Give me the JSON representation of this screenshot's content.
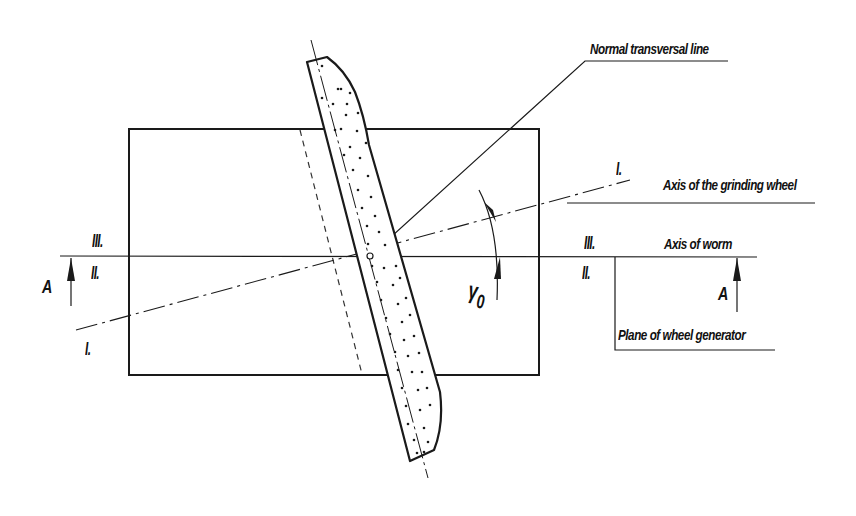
{
  "diagram": {
    "type": "technical drawing — worm grinding wheel setup",
    "colors": {
      "line": "#1a1a1a",
      "background": "#ffffff"
    },
    "labels": {
      "normal_transversal_line": "Normal transversal line",
      "axis_grinding_wheel": "Axis of the grinding wheel",
      "axis_worm": "Axis of worm",
      "plane_wheel_generator": "Plane of wheel generator",
      "angle_symbol": "γ",
      "angle_subscript": "0",
      "section_mark": "A",
      "roman_I": "I.",
      "roman_II": "II.",
      "roman_III": "III."
    },
    "elements": [
      "worm workpiece rectangle",
      "inclined grinding wheel (dotted abrasive section)",
      "axis I-I (grinding wheel axis, dash-dot)",
      "axis II/III (worm axis, thin horizontal)",
      "normal transversal line",
      "angle arc γ0 with arrows",
      "section arrows A-A"
    ]
  }
}
